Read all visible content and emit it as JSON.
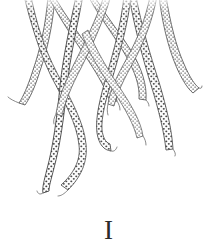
{
  "plate": {
    "caption": "I",
    "title": "Plate I",
    "subject": "cephalopod tentacles with suckers",
    "medium": "engraving",
    "background_color": "#ffffff",
    "ink_color": "#4a4a4a",
    "ink_color_dark": "#2b2b2b",
    "ink_color_light": "#8c8c8c",
    "width": 217,
    "height": 250
  },
  "figure": {
    "tentacle_count": 8,
    "crop_edge": "top",
    "tentacles": [
      {
        "id": "arm-1",
        "label": "far-left arm",
        "path": "M 36 -4 C 40 22 46 48 58 74 C 70 100 84 124 86 146 C 88 166 78 180 66 190",
        "width_base": 7.2,
        "width_tip": 1.0,
        "suckers": true
      },
      {
        "id": "arm-2",
        "label": "left outer arm",
        "path": "M 52 -4 C 49 26 40 54 32 76 C 26 92 22 100 20 104",
        "width_base": 5.4,
        "width_tip": 0.9,
        "suckers": true
      },
      {
        "id": "arm-3",
        "label": "left long arm",
        "path": "M 72 -4 C 66 26 60 56 58 86 C 56 116 52 146 46 168 C 42 182 40 188 42 192",
        "width_base": 7.6,
        "width_tip": 1.0,
        "suckers": true
      },
      {
        "id": "arm-4",
        "label": "left crossing arm",
        "path": "M 58 -4 C 70 18 84 38 96 56 C 108 74 116 88 118 100",
        "width_base": 6.0,
        "width_tip": 1.0,
        "suckers": true
      },
      {
        "id": "arm-5",
        "label": "central descending arm",
        "path": "M 120 -4 C 118 24 112 50 106 74 C 100 98 96 118 98 134 C 100 146 104 150 110 150",
        "width_base": 6.8,
        "width_tip": 1.0,
        "suckers": true
      },
      {
        "id": "arm-6",
        "label": "central crossing arm",
        "path": "M 98 -4 C 110 16 124 34 134 52 C 144 70 148 86 146 100",
        "width_base": 5.6,
        "width_tip": 0.9,
        "suckers": true
      },
      {
        "id": "arm-7",
        "label": "right long arm",
        "path": "M 140 -4 C 144 26 152 56 160 84 C 168 112 172 134 172 150",
        "width_base": 7.0,
        "width_tip": 1.0,
        "suckers": true
      },
      {
        "id": "arm-8",
        "label": "far-right arm",
        "path": "M 168 -4 C 172 24 178 48 186 66 C 192 80 196 86 198 88",
        "width_base": 5.8,
        "width_tip": 0.9,
        "suckers": true
      }
    ]
  }
}
